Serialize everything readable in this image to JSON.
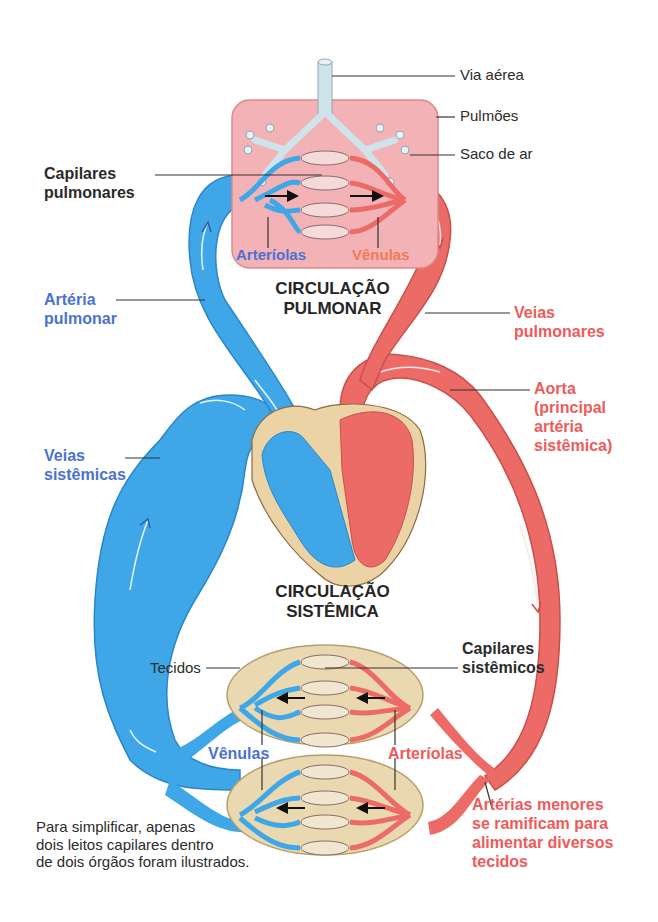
{
  "diagram": {
    "type": "double circulation system (pulmonary & systemic)",
    "colors": {
      "deoxygenated_blood": "#3fa7e8",
      "oxygenated_blood": "#ec6b67",
      "lung_tissue": "#f2b2b6",
      "airway": "#cfe3ea",
      "tissue_bed": "#e9d8b0",
      "heart_wall": "#ecd3a6",
      "label_blue": "#4b72d0",
      "label_red": "#ef5a5a"
    }
  },
  "labels": {
    "via_aerea": "Via aérea",
    "pulmoes": "Pulmões",
    "saco_de_ar": "Saco de ar",
    "capilares_pulmonares": "Capilares\npulmonares",
    "arteriolas_pulm": "Arteríolas",
    "venulas_pulm": "Vênulas",
    "circulacao_pulmonar": "CIRCULAÇÃO\nPULMONAR",
    "arteria_pulmonar": "Artéria\npulmonar",
    "veias_pulmonares": "Veias\npulmonares",
    "aorta": "Aorta\n(principal\nartéria\nsistêmica)",
    "veias_sistemicas": "Veias\nsistêmicas",
    "circulacao_sistemica": "CIRCULAÇÃO\nSISTÊMICA",
    "tecidos": "Tecidos",
    "capilares_sistemicos": "Capilares\nsistêmicos",
    "venulas_sist": "Vênulas",
    "arteriolas_sist": "Arteríolas",
    "arterias_menores": "Artérias menores\nse ramificam para\nalimentar diversos\ntecidos",
    "nota": "Para simplificar, apenas\ndois leitos capilares dentro\nde dois órgãos foram ilustrados."
  }
}
